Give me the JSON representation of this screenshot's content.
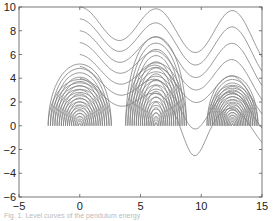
{
  "chart_data": {
    "type": "line",
    "title": "",
    "xlabel": "",
    "ylabel": "",
    "xlim": [
      -5,
      15
    ],
    "ylim": [
      -6,
      10
    ],
    "x_ticks": [
      -5,
      0,
      5,
      10,
      15
    ],
    "y_ticks": [
      -6,
      -4,
      -2,
      0,
      2,
      4,
      6,
      8,
      10
    ],
    "grid": false,
    "legend": null,
    "centers": [
      {
        "x": 0,
        "y": 0,
        "max_half_width": 2.6,
        "max_top": 3.9,
        "max_bottom": -5.2
      },
      {
        "x": 6.28,
        "y": 0,
        "max_half_width": 2.5,
        "max_top": 7.5,
        "max_bottom": -5.3
      },
      {
        "x": 12.57,
        "y": 0,
        "max_half_width": 2.1,
        "max_top": 3.4,
        "max_bottom": -4.2
      }
    ],
    "open_curves_start_y_at_x0": [
      10,
      9,
      8,
      7,
      6,
      5,
      4
    ],
    "line_color": "#808080"
  },
  "axes": {
    "x_tick_labels": [
      "−5",
      "0",
      "5",
      "10",
      "15"
    ],
    "y_tick_labels": [
      "−6",
      "−4",
      "−2",
      "0",
      "2",
      "4",
      "6",
      "8",
      "10"
    ]
  },
  "caption": "Fig. 1. Level curves of the pendulum energy"
}
